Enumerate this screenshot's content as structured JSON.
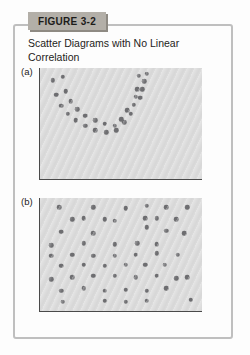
{
  "figure": {
    "label": "FIGURE 3-2",
    "title": "Scatter Diagrams with No Linear Correlation"
  },
  "colors": {
    "label_box_bg": "#b3afa8",
    "label_box_shadow": "#8e8a83",
    "frame_border": "#bfbfbf",
    "plot_bg": "#dcdcdc",
    "axis": "#4a4a4a",
    "dot": "#6f6f72",
    "text": "#1d1c1a"
  },
  "chart_data": [
    {
      "type": "scatter",
      "panel_label": "(a)",
      "pattern": "U-shaped curvilinear band of dots (no linear correlation)",
      "title": "",
      "xlabel": "",
      "ylabel": "",
      "axis_ticks": "none (unlabeled conceptual axes, left and bottom lines only)",
      "x_range": [
        0,
        100
      ],
      "y_range": [
        0,
        100
      ],
      "points": [
        [
          8,
          89
        ],
        [
          10,
          76
        ],
        [
          13,
          66
        ],
        [
          17,
          59
        ],
        [
          22,
          53
        ],
        [
          28,
          48
        ],
        [
          34,
          44
        ],
        [
          41,
          42
        ],
        [
          47,
          44
        ],
        [
          52,
          51
        ],
        [
          56,
          59
        ],
        [
          58,
          67
        ],
        [
          59,
          74
        ],
        [
          60,
          81
        ],
        [
          61,
          93
        ],
        [
          14,
          92
        ],
        [
          16,
          79
        ],
        [
          19,
          70
        ],
        [
          23,
          63
        ],
        [
          28,
          57
        ],
        [
          34,
          53
        ],
        [
          40,
          50
        ],
        [
          46,
          48
        ],
        [
          50,
          54
        ],
        [
          54,
          62
        ],
        [
          62,
          73
        ],
        [
          63,
          81
        ],
        [
          64.5,
          88
        ],
        [
          66,
          95
        ]
      ]
    },
    {
      "type": "scatter",
      "panel_label": "(b)",
      "pattern": "Dots scattered evenly over whole region (no correlation)",
      "title": "",
      "xlabel": "",
      "ylabel": "",
      "axis_ticks": "none (unlabeled conceptual axes, left and bottom lines only)",
      "x_range": [
        0,
        100
      ],
      "y_range": [
        0,
        100
      ],
      "points": [
        [
          12,
          92
        ],
        [
          33,
          92
        ],
        [
          53,
          91
        ],
        [
          66,
          93
        ],
        [
          78,
          92
        ],
        [
          91,
          92
        ],
        [
          20,
          81
        ],
        [
          27,
          82
        ],
        [
          40,
          81
        ],
        [
          46,
          80
        ],
        [
          65,
          82
        ],
        [
          72,
          82
        ],
        [
          84,
          81
        ],
        [
          13,
          70
        ],
        [
          33,
          69
        ],
        [
          66,
          74
        ],
        [
          78,
          71
        ],
        [
          89,
          69
        ],
        [
          7,
          58
        ],
        [
          27,
          60
        ],
        [
          46,
          59
        ],
        [
          60,
          60
        ],
        [
          72,
          59
        ],
        [
          7,
          49
        ],
        [
          20,
          50
        ],
        [
          33,
          49
        ],
        [
          46,
          49
        ],
        [
          59,
          50
        ],
        [
          72,
          51
        ],
        [
          85,
          50
        ],
        [
          13,
          40
        ],
        [
          27,
          41
        ],
        [
          40,
          40
        ],
        [
          53,
          41
        ],
        [
          65,
          41
        ],
        [
          77,
          41
        ],
        [
          7,
          28
        ],
        [
          20,
          30
        ],
        [
          33,
          31
        ],
        [
          46,
          31
        ],
        [
          59,
          30
        ],
        [
          72,
          31
        ],
        [
          84,
          29
        ],
        [
          91,
          30
        ],
        [
          13,
          18
        ],
        [
          27,
          20
        ],
        [
          40,
          18
        ],
        [
          53,
          19
        ],
        [
          66,
          18
        ],
        [
          78,
          20
        ],
        [
          14,
          8
        ],
        [
          40,
          9
        ],
        [
          53,
          8
        ],
        [
          66,
          9
        ],
        [
          93,
          10
        ]
      ]
    }
  ]
}
